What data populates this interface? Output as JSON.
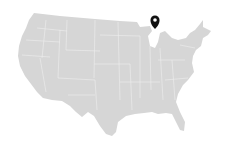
{
  "map": {
    "region": "United States (contiguous)",
    "fill_color": "#d6d6d6",
    "border_color": "#eeeeee",
    "background_color": "#ffffff",
    "marker": {
      "icon": "map-pin-icon",
      "color": "#111111",
      "location": "Michigan"
    }
  }
}
